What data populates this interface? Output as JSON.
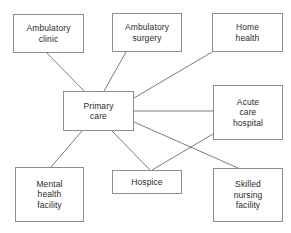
{
  "diagram": {
    "type": "node-link-network",
    "width": 291,
    "height": 233,
    "background_color": "#ffffff",
    "node_border_color": "#8d8d8d",
    "edge_color": "#6e6e6e",
    "text_color": "#2b2b2b",
    "nodes": [
      {
        "id": "ambulatory-clinic",
        "label": "Ambulatory\nclinic",
        "x": 13,
        "y": 14,
        "w": 71,
        "h": 39
      },
      {
        "id": "ambulatory-surgery",
        "label": "Ambulatory\nsurgery",
        "x": 112,
        "y": 13,
        "w": 70,
        "h": 39
      },
      {
        "id": "home-health",
        "label": "Home\nhealth",
        "x": 212,
        "y": 13,
        "w": 71,
        "h": 39
      },
      {
        "id": "primary-care",
        "label": "Primary\ncare",
        "x": 63,
        "y": 91,
        "w": 71,
        "h": 40
      },
      {
        "id": "acute-care-hospital",
        "label": "Acute\ncare\nhospital",
        "x": 213,
        "y": 85,
        "w": 70,
        "h": 55
      },
      {
        "id": "mental-health-facility",
        "label": "Mental\nhealth\nfacility",
        "x": 15,
        "y": 167,
        "w": 69,
        "h": 55
      },
      {
        "id": "hospice",
        "label": "Hospice",
        "x": 112,
        "y": 170,
        "w": 70,
        "h": 24
      },
      {
        "id": "skilled-nursing-facility",
        "label": "Skilled\nnursing\nfacility",
        "x": 213,
        "y": 168,
        "w": 70,
        "h": 54
      }
    ],
    "edges": [
      {
        "id": "edge-ambulatory-clinic-primary-care",
        "from": "ambulatory-clinic",
        "to": "primary-care",
        "x1": 47,
        "y1": 53,
        "x2": 84,
        "y2": 91
      },
      {
        "id": "edge-ambulatory-surgery-primary-care",
        "from": "ambulatory-surgery",
        "to": "primary-care",
        "x1": 126,
        "y1": 52,
        "x2": 104,
        "y2": 91
      },
      {
        "id": "edge-home-health-primary-care",
        "from": "home-health",
        "to": "primary-care",
        "x1": 212,
        "y1": 52,
        "x2": 134,
        "y2": 98
      },
      {
        "id": "edge-primary-care-acute-care-hospital",
        "from": "primary-care",
        "to": "acute-care-hospital",
        "x1": 134,
        "y1": 111,
        "x2": 213,
        "y2": 111
      },
      {
        "id": "edge-primary-care-skilled-nursing-facility",
        "from": "primary-care",
        "to": "skilled-nursing-facility",
        "x1": 134,
        "y1": 122,
        "x2": 238,
        "y2": 168
      },
      {
        "id": "edge-acute-care-hospital-hospice",
        "from": "acute-care-hospital",
        "to": "hospice",
        "x1": 213,
        "y1": 134,
        "x2": 152,
        "y2": 170
      },
      {
        "id": "edge-primary-care-hospice",
        "from": "primary-care",
        "to": "hospice",
        "x1": 112,
        "y1": 131,
        "x2": 150,
        "y2": 170
      },
      {
        "id": "edge-primary-care-mental-health-facility",
        "from": "primary-care",
        "to": "mental-health-facility",
        "x1": 82,
        "y1": 131,
        "x2": 51,
        "y2": 167
      }
    ]
  }
}
